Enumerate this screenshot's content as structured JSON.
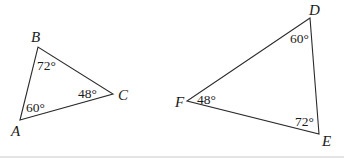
{
  "figure": {
    "triangles": [
      {
        "name": "ABC",
        "vertices": {
          "A": {
            "label": "A",
            "x": 20,
            "y": 120,
            "angle": "60°"
          },
          "B": {
            "label": "B",
            "x": 38,
            "y": 47,
            "angle": "72°"
          },
          "C": {
            "label": "C",
            "x": 113,
            "y": 94,
            "angle": "48°"
          }
        }
      },
      {
        "name": "DEF",
        "vertices": {
          "D": {
            "label": "D",
            "x": 310,
            "y": 18,
            "angle": "60°"
          },
          "E": {
            "label": "E",
            "x": 319,
            "y": 134,
            "angle": "72°"
          },
          "F": {
            "label": "F",
            "x": 187,
            "y": 101,
            "angle": "48°"
          }
        }
      }
    ],
    "colors": {
      "stroke": "#2a2a2a",
      "text": "#1a1a1a",
      "background": "#ffffff"
    }
  }
}
